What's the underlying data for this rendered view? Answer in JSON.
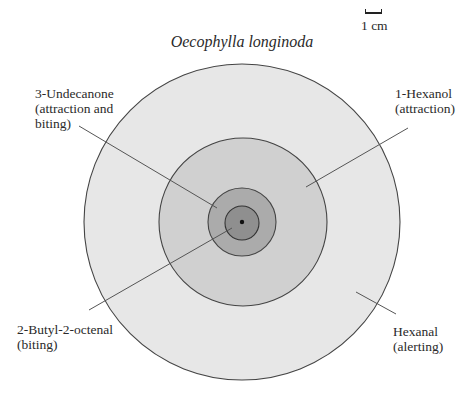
{
  "title": "Oecophylla longinoda",
  "scale_bar": {
    "label": "1 cm"
  },
  "zones": [
    {
      "id": "hexanal",
      "name": "Hexanal",
      "effect": "(alerting)",
      "fill": "#e6e6e6",
      "cx": 242,
      "cy": 222,
      "r": 158
    },
    {
      "id": "hexanol",
      "name": "1-Hexanol",
      "effect": "(attraction)",
      "fill": "#cfcfcf",
      "cx": 243,
      "cy": 222,
      "r": 84
    },
    {
      "id": "undecanone",
      "name": "3-Undecanone",
      "effect": "(attraction and",
      "effect_line2": "biting)",
      "fill": "#ababab",
      "cx": 242,
      "cy": 222,
      "r": 34
    },
    {
      "id": "butyloctenal",
      "name": "2-Butyl-2-octenal",
      "effect": "(biting)",
      "fill": "#8e8e8e",
      "cx": 242,
      "cy": 223,
      "r": 17
    }
  ],
  "source_dot": {
    "cx": 242,
    "cy": 222,
    "r": 2.2,
    "fill": "#111111"
  },
  "colors": {
    "outline": "#444444",
    "leader": "#555555"
  },
  "labels": {
    "undecanone": {
      "line1": "3-Undecanone",
      "line2": "(attraction and",
      "line3": "biting)"
    },
    "hexanol": {
      "line1": "1-Hexanol",
      "line2": "(attraction)"
    },
    "butyloctenal": {
      "line1": "2-Butyl-2-octenal",
      "line2": "(biting)"
    },
    "hexanal": {
      "line1": "Hexanal",
      "line2": "(alerting)"
    }
  }
}
